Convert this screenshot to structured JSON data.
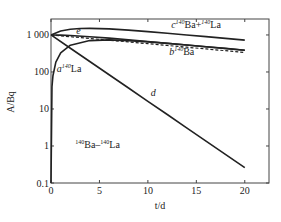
{
  "chart_data": {
    "type": "line",
    "title": "",
    "xlabel": "t/d",
    "ylabel": "A/Bq",
    "yscale": "log",
    "xlim": [
      0,
      22.5
    ],
    "ylim": [
      0.1,
      2700
    ],
    "x_ticks": [
      0,
      5,
      10,
      15,
      20
    ],
    "x_tick_labels": [
      "0",
      "5",
      "10",
      "15",
      "20"
    ],
    "y_ticks": [
      0.1,
      1,
      10,
      100,
      1000
    ],
    "y_tick_labels": [
      "0.1",
      "1",
      "10",
      "100",
      "1 000"
    ],
    "grid": false,
    "annotation": {
      "text_parts": [
        "140",
        "Ba–",
        "140",
        "La"
      ],
      "x": 2.5,
      "y": 0.9
    },
    "series": [
      {
        "id": "a",
        "name": "140La",
        "label_letter": "a",
        "label_iso": [
          "140",
          "La"
        ],
        "style": "solid",
        "label_pos": {
          "x": 0.6,
          "y": 100
        },
        "x": [
          0,
          0.1,
          0.2,
          0.5,
          1,
          2,
          4,
          6,
          8,
          10,
          12,
          14,
          16,
          18,
          20
        ],
        "values": [
          0.1,
          40,
          79,
          184,
          328,
          529,
          705,
          735,
          703,
          651,
          592,
          534,
          481,
          432,
          388
        ]
      },
      {
        "id": "b",
        "name": "140Ba",
        "label_letter": "b",
        "label_iso": [
          "140",
          "Ba"
        ],
        "style": "dashed",
        "label_pos": {
          "x": 12.2,
          "y": 280
        },
        "x": [
          0,
          2,
          4,
          6,
          8,
          10,
          12,
          14,
          16,
          18,
          20
        ],
        "values": [
          1000,
          897,
          804,
          722,
          647,
          581,
          521,
          467,
          419,
          376,
          337
        ]
      },
      {
        "id": "c",
        "name": "140Ba+140La",
        "label_letter": "c",
        "label_iso": [
          "140",
          "Ba+",
          "140",
          "La"
        ],
        "style": "solid",
        "label_pos": {
          "x": 12.4,
          "y": 1500
        },
        "x": [
          0,
          1,
          2,
          3,
          4,
          6,
          8,
          10,
          12,
          14,
          16,
          18,
          20
        ],
        "values": [
          1000,
          1275,
          1426,
          1490,
          1509,
          1457,
          1350,
          1232,
          1113,
          1001,
          900,
          808,
          725
        ]
      },
      {
        "id": "d",
        "name": "d",
        "label_letter": "d",
        "label_iso": [],
        "style": "solid",
        "label_pos": {
          "x": 10.3,
          "y": 22
        },
        "x": [
          0,
          2,
          4,
          6,
          8,
          10,
          12,
          14,
          16,
          18,
          20
        ],
        "values": [
          1000,
          438,
          192,
          84.1,
          36.9,
          16.1,
          7.08,
          3.1,
          1.36,
          0.595,
          0.261
        ]
      },
      {
        "id": "e",
        "name": "e",
        "label_letter": "e",
        "label_iso": [],
        "style": "solid",
        "label_pos": {
          "x": 2.6,
          "y": 1080
        },
        "x": [
          0,
          1,
          2,
          4,
          6,
          8,
          10,
          12,
          14,
          16,
          18,
          20
        ],
        "values": [
          1000,
          990,
          967,
          897,
          819,
          740,
          667,
          599,
          537,
          482,
          433,
          388
        ]
      }
    ]
  }
}
